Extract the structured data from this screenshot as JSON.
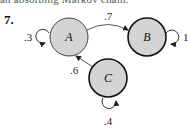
{
  "header": {
    "cut_off_text": "an absorbing Markov chain.",
    "problem_number": "7."
  },
  "diagram": {
    "type": "markov-chain-state-diagram",
    "node_fill": "#d4d4d4",
    "node_stroke": "#111111",
    "nodes": [
      {
        "id": "A",
        "label": "A",
        "cx": 69,
        "cy": 37,
        "r": 19
      },
      {
        "id": "B",
        "label": "B",
        "cx": 147,
        "cy": 37,
        "r": 19
      },
      {
        "id": "C",
        "label": "C",
        "cx": 108,
        "cy": 78,
        "r": 19
      }
    ],
    "edges": [
      {
        "from": "A",
        "to": "A",
        "label": ".3"
      },
      {
        "from": "A",
        "to": "B",
        "label": ".7"
      },
      {
        "from": "B",
        "to": "B",
        "label": "1"
      },
      {
        "from": "C",
        "to": "A",
        "label": ".6"
      },
      {
        "from": "C",
        "to": "C",
        "label": ".4"
      }
    ]
  }
}
